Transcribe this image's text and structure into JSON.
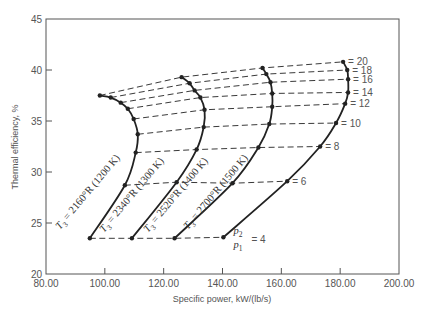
{
  "chart_data": {
    "type": "line",
    "title": "",
    "xlabel": "Specific power, kW/(lb/s)",
    "ylabel": "Thermal efficiency, %",
    "xlim": [
      80,
      200
    ],
    "ylim": [
      20,
      45
    ],
    "xticks": [
      "80.00",
      "100.00",
      "120.00",
      "140.00",
      "160.00",
      "180.00",
      "200.00"
    ],
    "yticks": [
      "20",
      "25",
      "30",
      "35",
      "40",
      "45"
    ],
    "grid": false,
    "pressure_ratios": [
      4,
      6,
      8,
      10,
      12,
      14,
      16,
      18,
      20
    ],
    "pressure_ratio_label": {
      "numerator": "p2",
      "denominator": "p1",
      "value": "= 4"
    },
    "pressure_line_labels": [
      "= 6",
      "= 8",
      "= 10",
      "= 12",
      "= 14",
      "= 16",
      "= 18",
      "= 20"
    ],
    "series": [
      {
        "name": "T3 = 2160°R (1200 K)",
        "label_sub": "3",
        "label_rest": " = 2160°R (1200 K)",
        "x": [
          94.9,
          106.8,
          110.5,
          111.2,
          109.8,
          107.8,
          105.4,
          102.0,
          98.3
        ],
        "y": [
          23.5,
          28.7,
          31.9,
          33.7,
          35.2,
          36.2,
          36.8,
          37.3,
          37.5
        ]
      },
      {
        "name": "T3 = 2340°R (1300 K)",
        "label_sub": "3",
        "label_rest": " = 2340°R (1300 K)",
        "x": [
          109.2,
          124.4,
          131.2,
          133.6,
          133.9,
          132.5,
          130.5,
          128.8,
          126.1
        ],
        "y": [
          23.5,
          29.0,
          32.2,
          34.4,
          36.1,
          37.3,
          38.0,
          38.7,
          39.3
        ]
      },
      {
        "name": "T3 = 2520°R (1400 K)",
        "label_sub": "3",
        "label_rest": " = 2520°R (1400 K)",
        "x": [
          123.7,
          143.4,
          152.2,
          155.9,
          156.9,
          156.9,
          156.3,
          154.9,
          153.6
        ],
        "y": [
          23.5,
          28.9,
          32.4,
          34.7,
          36.4,
          37.7,
          38.8,
          39.6,
          40.2
        ]
      },
      {
        "name": "T3 = 2700°R (1500 K)",
        "label_sub": "3",
        "label_rest": " = 2700°R (1500 K)",
        "x": [
          140.3,
          162.0,
          173.2,
          178.6,
          181.7,
          182.7,
          182.7,
          182.4,
          181.0
        ],
        "y": [
          23.6,
          29.1,
          32.5,
          34.8,
          36.7,
          37.8,
          39.1,
          40.0,
          40.8
        ]
      }
    ],
    "line_styles": {
      "temperature_curves": "solid",
      "pressure_ratio_lines": "dashed"
    },
    "colors": {
      "line": "#222222",
      "axis": "#555555",
      "text": "#555555"
    }
  }
}
